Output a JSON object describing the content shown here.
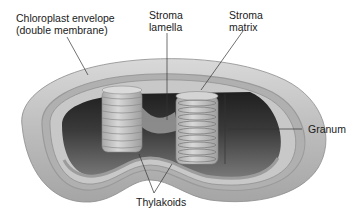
{
  "diagram": {
    "colors": {
      "envelope_outer": "#b9b9b9",
      "envelope_highlight": "#d6d6d6",
      "envelope_inner": "#a8a8a8",
      "stroma_dark": "#3a3a3a",
      "stroma_floor": "#6e6e6e",
      "granum": "#c4c4c4",
      "granum_line": "#8a8a8a",
      "leader_line": "#333333",
      "text": "#1a1a1a"
    },
    "labels": {
      "envelope": {
        "line1": "Chloroplast envelope",
        "line2": "(double membrane)"
      },
      "stroma_lamella": {
        "line1": "Stroma",
        "line2": "lamella"
      },
      "stroma_matrix": {
        "line1": "Stroma",
        "line2": "matrix"
      },
      "granum": {
        "text": "Granum"
      },
      "thylakoids": {
        "text": "Thylakoids"
      }
    }
  }
}
